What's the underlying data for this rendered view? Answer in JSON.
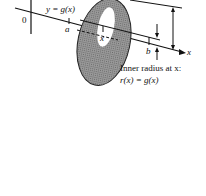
{
  "figure": {
    "labels": {
      "curve": "y = g(x)",
      "origin": "0",
      "a": "a",
      "b": "b",
      "x_tick": "x",
      "x_axis": "x",
      "caption_line1": "Inner radius at x:",
      "caption_line2": "r(x) = g(x)"
    },
    "colors": {
      "ink": "#111111",
      "washer_fill": "#8a8a8a",
      "washer_dark": "#5e5e5e",
      "background": "#ffffff"
    }
  }
}
